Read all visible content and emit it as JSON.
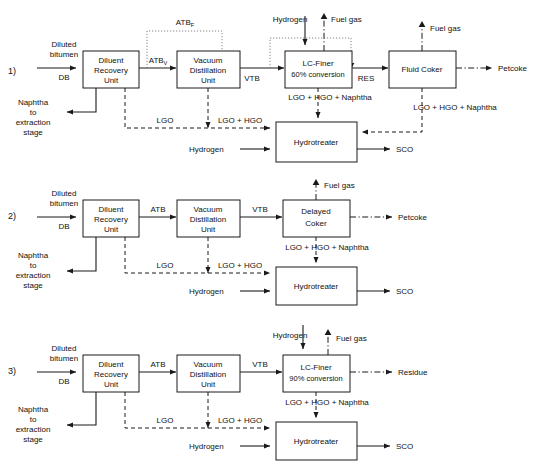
{
  "figure": {
    "type": "process-flow-diagram",
    "rows": [
      {
        "number": "1)",
        "inputs": {
          "feed_line1": "Diluted",
          "feed_line2": "bitumen",
          "feed_abbr": "DB",
          "naphtha_l1": "Naphtha",
          "naphtha_l2": "to",
          "naphtha_l3": "extraction",
          "naphtha_l4": "stage",
          "hydrogen_top": "Hydrogen",
          "hydrogen_ht": "Hydrogen"
        },
        "blocks": [
          {
            "id": "dru",
            "line1": "Diluent",
            "line2": "Recovery",
            "line3": "Unit"
          },
          {
            "id": "vdu",
            "line1": "Vacuum",
            "line2": "Distillation",
            "line3": "Unit"
          },
          {
            "id": "lcfiner",
            "line1": "LC-Finer",
            "line2": "60% conversion"
          },
          {
            "id": "coker",
            "line1": "Fluid Coker"
          },
          {
            "id": "hydrotreater",
            "line1": "Hydrotreater"
          }
        ],
        "streams": {
          "atb_bypass": "ATB",
          "atb_bypass_sub": "F",
          "atb_vac": "ATB",
          "atb_vac_sub": "V",
          "vtb": "VTB",
          "res": "RES",
          "lgo": "LGO",
          "lgo_hgo": "LGO + HGO",
          "lgo_hgo_naphtha_left": "LGO + HGO + Naphtha",
          "lgo_hgo_naphtha_right": "LGO + HGO + Naphtha",
          "fuel_gas_lcfiner": "Fuel gas",
          "fuel_gas_coker": "Fuel gas",
          "petcoke": "Petcoke",
          "sco": "SCO"
        }
      },
      {
        "number": "2)",
        "inputs": {
          "feed_line1": "Diluted",
          "feed_line2": "bitumen",
          "feed_abbr": "DB",
          "naphtha_l1": "Naphtha",
          "naphtha_l2": "to",
          "naphtha_l3": "extraction",
          "naphtha_l4": "stage",
          "hydrogen_ht": "Hydrogen"
        },
        "blocks": [
          {
            "id": "dru",
            "line1": "Diluent",
            "line2": "Recovery",
            "line3": "Unit"
          },
          {
            "id": "vdu",
            "line1": "Vacuum",
            "line2": "Distillation",
            "line3": "Unit"
          },
          {
            "id": "coker",
            "line1": "Delayed",
            "line2": "Coker"
          },
          {
            "id": "hydrotreater",
            "line1": "Hydrotreater"
          }
        ],
        "streams": {
          "atb": "ATB",
          "vtb": "VTB",
          "lgo": "LGO",
          "lgo_hgo": "LGO + HGO",
          "lgo_hgo_naphtha": "LGO + HGO + Naphtha",
          "fuel_gas": "Fuel gas",
          "petcoke": "Petcoke",
          "sco": "SCO"
        }
      },
      {
        "number": "3)",
        "inputs": {
          "feed_line1": "Diluted",
          "feed_line2": "bitumen",
          "feed_abbr": "DB",
          "naphtha_l1": "Naphtha",
          "naphtha_l2": "to",
          "naphtha_l3": "extraction",
          "naphtha_l4": "stage",
          "hydrogen_top": "Hydrogen",
          "hydrogen_ht": "Hydrogen"
        },
        "blocks": [
          {
            "id": "dru",
            "line1": "Diluent",
            "line2": "Recovery",
            "line3": "Unit"
          },
          {
            "id": "vdu",
            "line1": "Vacuum",
            "line2": "Distillation",
            "line3": "Unit"
          },
          {
            "id": "lcfiner",
            "line1": "LC-Finer",
            "line2": "90% conversion"
          },
          {
            "id": "hydrotreater",
            "line1": "Hydrotreater"
          }
        ],
        "streams": {
          "atb": "ATB",
          "vtb": "VTB",
          "lgo": "LGO",
          "lgo_hgo": "LGO + HGO",
          "lgo_hgo_naphtha": "LGO + HGO + Naphtha",
          "fuel_gas": "Fuel gas",
          "residue": "Residue",
          "sco": "SCO"
        }
      }
    ],
    "colors": {
      "stroke": "#1a1a1a",
      "dotted": "#777777",
      "background": "#ffffff"
    }
  }
}
